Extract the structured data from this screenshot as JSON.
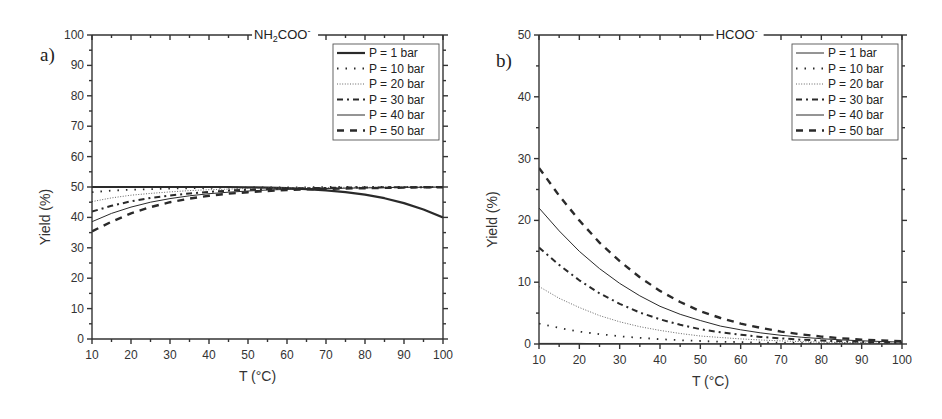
{
  "chart_data": [
    {
      "panel": "a)",
      "type": "line",
      "title": "NH2COO-",
      "title_main": "NH",
      "title_sub": "2",
      "title_rest": "COO",
      "title_sup": "-",
      "xlabel": "T (°C)",
      "ylabel": "Yield (%)",
      "xlim": [
        10,
        100
      ],
      "ylim": [
        0,
        100
      ],
      "xticks": [
        10,
        20,
        30,
        40,
        50,
        60,
        70,
        80,
        90,
        100
      ],
      "yticks": [
        0,
        10,
        20,
        30,
        40,
        50,
        60,
        70,
        80,
        90,
        100
      ],
      "grid": false,
      "legend_position": "upper right",
      "x": [
        10,
        15,
        20,
        25,
        30,
        35,
        40,
        45,
        50,
        55,
        60,
        65,
        70,
        75,
        80,
        85,
        90,
        95,
        100
      ],
      "series": [
        {
          "name": "P = 1 bar",
          "style": "solid-thick",
          "values": [
            50.0,
            50.0,
            50.0,
            50.0,
            50.0,
            50.0,
            50.0,
            50.0,
            49.9,
            49.8,
            49.6,
            49.3,
            48.9,
            48.3,
            47.5,
            46.3,
            44.7,
            42.6,
            40.0
          ]
        },
        {
          "name": "P = 10 bar",
          "style": "dotted-sparse",
          "values": [
            48.3,
            48.8,
            49.1,
            49.3,
            49.5,
            49.6,
            49.7,
            49.8,
            49.8,
            49.9,
            49.9,
            49.9,
            50.0,
            50.0,
            50.0,
            50.0,
            50.0,
            50.0,
            50.0
          ]
        },
        {
          "name": "P = 20 bar",
          "style": "dotted-dense",
          "values": [
            45.2,
            46.4,
            47.3,
            47.9,
            48.4,
            48.8,
            49.1,
            49.3,
            49.5,
            49.6,
            49.7,
            49.8,
            49.8,
            49.9,
            49.9,
            49.9,
            50.0,
            50.0,
            50.0
          ]
        },
        {
          "name": "P = 30 bar",
          "style": "dash-dot",
          "values": [
            41.9,
            43.8,
            45.3,
            46.4,
            47.2,
            47.9,
            48.4,
            48.8,
            49.1,
            49.3,
            49.5,
            49.6,
            49.7,
            49.8,
            49.8,
            49.9,
            49.9,
            49.9,
            50.0
          ]
        },
        {
          "name": "P = 40 bar",
          "style": "solid-thin",
          "values": [
            38.6,
            41.3,
            43.4,
            45.0,
            46.2,
            47.1,
            47.8,
            48.3,
            48.7,
            49.0,
            49.2,
            49.4,
            49.5,
            49.6,
            49.7,
            49.8,
            49.9,
            49.9,
            50.0
          ]
        },
        {
          "name": "P = 50 bar",
          "style": "dashed",
          "values": [
            35.4,
            38.6,
            41.3,
            43.4,
            45.0,
            46.2,
            47.1,
            47.8,
            48.3,
            48.7,
            49.0,
            49.2,
            49.4,
            49.5,
            49.6,
            49.7,
            49.8,
            49.9,
            49.9
          ]
        }
      ]
    },
    {
      "panel": "b)",
      "type": "line",
      "title": "HCOO-",
      "title_main": "HCOO",
      "title_sub": "",
      "title_rest": "",
      "title_sup": "-",
      "xlabel": "T (°C)",
      "ylabel": "Yield (%)",
      "xlim": [
        10,
        100
      ],
      "ylim": [
        0,
        50
      ],
      "xticks": [
        10,
        20,
        30,
        40,
        50,
        60,
        70,
        80,
        90,
        100
      ],
      "yticks": [
        0,
        10,
        20,
        30,
        40,
        50
      ],
      "grid": false,
      "legend_position": "upper right",
      "x": [
        10,
        15,
        20,
        25,
        30,
        35,
        40,
        45,
        50,
        55,
        60,
        65,
        70,
        75,
        80,
        85,
        90,
        95,
        100
      ],
      "series": [
        {
          "name": "P = 1 bar",
          "style": "solid-thin-legend",
          "values": [
            0.1,
            0.1,
            0.1,
            0.05,
            0.05,
            0.05,
            0.03,
            0.03,
            0.02,
            0.02,
            0.02,
            0.01,
            0.01,
            0.01,
            0.01,
            0.01,
            0.0,
            0.0,
            0.0
          ]
        },
        {
          "name": "P = 10 bar",
          "style": "dotted-sparse",
          "values": [
            3.3,
            2.6,
            2.0,
            1.6,
            1.25,
            1.0,
            0.78,
            0.61,
            0.48,
            0.38,
            0.3,
            0.24,
            0.19,
            0.15,
            0.12,
            0.1,
            0.08,
            0.06,
            0.05
          ]
        },
        {
          "name": "P = 20 bar",
          "style": "dotted-dense",
          "values": [
            9.3,
            7.4,
            5.9,
            4.6,
            3.6,
            2.8,
            2.2,
            1.7,
            1.3,
            1.05,
            0.82,
            0.64,
            0.5,
            0.39,
            0.31,
            0.24,
            0.19,
            0.15,
            0.12
          ]
        },
        {
          "name": "P = 30 bar",
          "style": "dash-dot",
          "values": [
            15.6,
            12.8,
            10.3,
            8.2,
            6.5,
            5.1,
            4.0,
            3.1,
            2.4,
            1.9,
            1.5,
            1.15,
            0.9,
            0.7,
            0.55,
            0.43,
            0.34,
            0.26,
            0.2
          ]
        },
        {
          "name": "P = 40 bar",
          "style": "solid-thin",
          "values": [
            22.0,
            18.3,
            15.0,
            12.2,
            9.8,
            7.8,
            6.1,
            4.8,
            3.8,
            2.9,
            2.3,
            1.8,
            1.4,
            1.1,
            0.85,
            0.66,
            0.52,
            0.4,
            0.31
          ]
        },
        {
          "name": "P = 50 bar",
          "style": "dashed",
          "values": [
            28.5,
            24.0,
            20.0,
            16.4,
            13.4,
            10.8,
            8.6,
            6.8,
            5.3,
            4.2,
            3.3,
            2.6,
            2.0,
            1.55,
            1.2,
            0.93,
            0.72,
            0.56,
            0.43
          ]
        }
      ]
    }
  ],
  "layout": {
    "panels": [
      {
        "left": 92,
        "right": 443,
        "top": 35,
        "bottom": 339,
        "label_x": 40,
        "label_y": 58
      },
      {
        "left": 539,
        "right": 902,
        "top": 35,
        "bottom": 344,
        "label_x": 496,
        "label_y": 58
      }
    ]
  },
  "colors": {
    "axis": "#333333",
    "line": "#2a2a2a",
    "line_light": "#555555",
    "text": "#333333"
  }
}
